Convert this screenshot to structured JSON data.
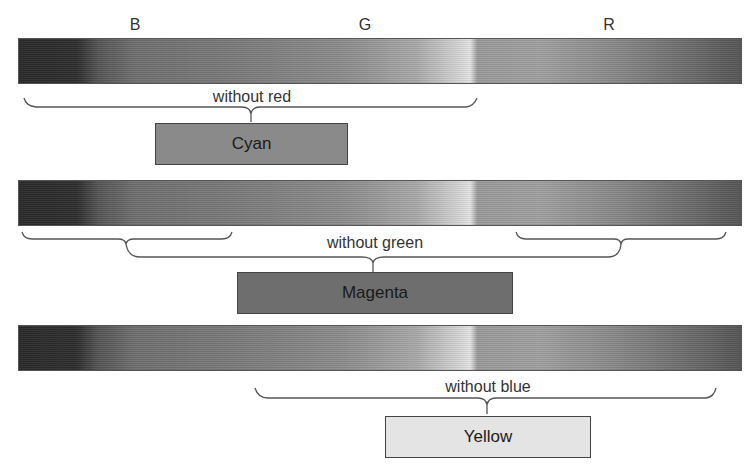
{
  "band_labels": [
    {
      "id": "blue",
      "label": "B",
      "x": 135
    },
    {
      "id": "green",
      "label": "G",
      "x": 365
    },
    {
      "id": "red",
      "label": "R",
      "x": 609
    }
  ],
  "rows": [
    {
      "spectrum_top": 38,
      "subtractive_label": "without red",
      "result": {
        "label": "Cyan",
        "color": "#8a8a8a"
      }
    },
    {
      "spectrum_top": 180,
      "subtractive_label": "without green",
      "result": {
        "label": "Magenta",
        "color": "#6e6e6e"
      }
    },
    {
      "spectrum_top": 325,
      "subtractive_label": "without blue",
      "result": {
        "label": "Yellow",
        "color": "#e4e4e4"
      }
    }
  ]
}
